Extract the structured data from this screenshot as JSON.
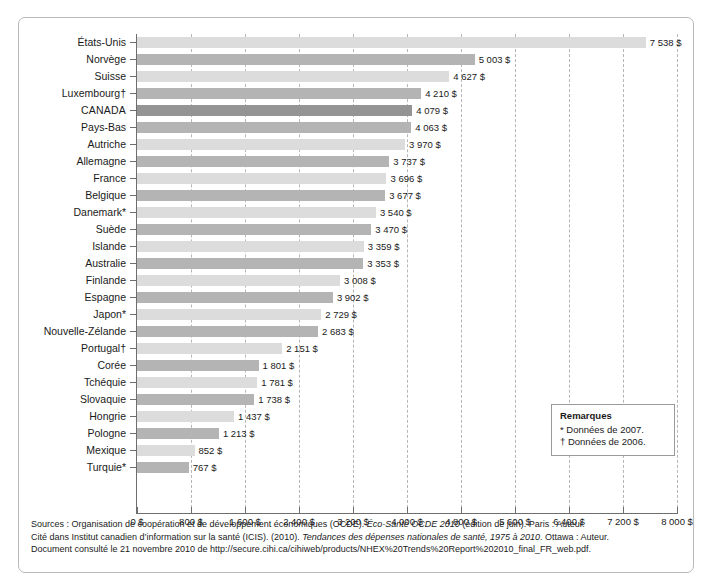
{
  "chart_data": {
    "type": "bar",
    "orientation": "horizontal",
    "title": "",
    "subtitle": "",
    "xlabel": "",
    "ylabel": "",
    "xlim": [
      0,
      8000
    ],
    "xtick_step": 800,
    "grid": "vertical-dashed",
    "legend_position": "inside-right",
    "categories": [
      "États-Unis",
      "Norvège",
      "Suisse",
      "Luxembourg†",
      "CANADA",
      "Pays-Bas",
      "Autriche",
      "Allemagne",
      "France",
      "Belgique",
      "Danemark*",
      "Suède",
      "Islande",
      "Australie",
      "Finlande",
      "Espagne",
      "Japon*",
      "Nouvelle-Zélande",
      "Portugal†",
      "Corée",
      "Tchéquie",
      "Slovaquie",
      "Hongrie",
      "Pologne",
      "Mexique",
      "Turquie*"
    ],
    "values": [
      7538,
      5003,
      4627,
      4210,
      4079,
      4063,
      3970,
      3737,
      3696,
      3677,
      3540,
      3470,
      3359,
      3353,
      3008,
      2902,
      2729,
      2683,
      2151,
      1801,
      1781,
      1738,
      1437,
      1213,
      852,
      767
    ],
    "value_labels": [
      "7 538 $",
      "5 003 $",
      "4 627 $",
      "4 210 $",
      "4 079 $",
      "4 063 $",
      "3 970 $",
      "3 737 $",
      "3 696 $",
      "3 677 $",
      "3 540 $",
      "3 470 $",
      "3 359 $",
      "3 353 $",
      "3 008 $",
      "3 902 $",
      "2 729 $",
      "2 683 $",
      "2 151 $",
      "1 801 $",
      "1 781 $",
      "1 738 $",
      "1 437 $",
      "1 213 $",
      "852 $",
      "767 $"
    ],
    "xtick_labels": [
      "0 $",
      "800 $",
      "1 600 $",
      "2 400 $",
      "3 200 $",
      "4 000 $",
      "4 800 $",
      "5 600 $",
      "6 400 $",
      "7 200 $",
      "8 000 $"
    ],
    "xtick_values": [
      0,
      800,
      1600,
      2400,
      3200,
      4000,
      4800,
      5600,
      6400,
      7200,
      8000
    ],
    "bar_colors": [
      "#dcdcdc",
      "#b4b4b4",
      "#dcdcdc",
      "#b4b4b4",
      "#949494",
      "#b4b4b4",
      "#dcdcdc",
      "#b4b4b4",
      "#dcdcdc",
      "#b4b4b4",
      "#dcdcdc",
      "#b4b4b4",
      "#dcdcdc",
      "#b4b4b4",
      "#dcdcdc",
      "#b4b4b4",
      "#dcdcdc",
      "#b4b4b4",
      "#dcdcdc",
      "#b4b4b4",
      "#dcdcdc",
      "#b4b4b4",
      "#dcdcdc",
      "#b4b4b4",
      "#dcdcdc",
      "#b4b4b4"
    ],
    "highlight_category": "CANADA",
    "highlight_color": "#949494",
    "axis_color": "#6e6e6e",
    "grid_color": "#b6b6b6"
  },
  "remarks": {
    "title": "Remarques",
    "note_star": "* Données de 2007.",
    "note_dagger": "† Données de 2006."
  },
  "sources": {
    "line1_a": "Sources : Organisation de coopération et de développement économiques (OCDE). ",
    "line1_i": "Éco-Santé OCDE 2010",
    "line1_b": " (édition de juin). Paris : Auteur.",
    "line2_a": "Cité dans Institut canadien d’information sur la santé (ICIS). (2010). ",
    "line2_i": "Tendances des dépenses nationales de santé, 1975 à 2010",
    "line2_b": ". Ottawa : Auteur.",
    "line3": "Document consulté le 21 novembre 2010 de http://secure.cihi.ca/cihiweb/products/NHEX%20Trends%20Report%202010_final_FR_web.pdf."
  }
}
